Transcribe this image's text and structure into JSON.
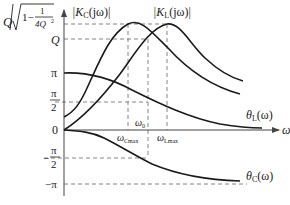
{
  "diagram": {
    "title": "",
    "x_axis": {
      "label": "ω"
    },
    "y_axis_labels": {
      "top_prefix": "Q",
      "top_num": "1",
      "top_den": "4Q",
      "top_den_exp": "2",
      "top_one_minus": "1−",
      "q": "Q",
      "pi": "π",
      "pi_half_num": "π",
      "pi_half_den": "2",
      "zero": "0",
      "neg_pi_half_num": "π",
      "neg_pi_half_den": "2",
      "neg_pi_half_sign": "−",
      "neg_pi": "−π"
    },
    "curves": {
      "kc": "|K",
      "kc_sub": "C",
      "kc_tail": "(jω)|",
      "kl": "|K",
      "kl_sub": "L",
      "kl_tail": "(jω)|",
      "theta_l": "θ",
      "theta_l_sub": "L",
      "theta_l_tail": "(ω)",
      "theta_c": "θ",
      "theta_c_sub": "C",
      "theta_c_tail": "(ω)"
    },
    "freq_labels": {
      "w0": "ω",
      "w0_sub": "0",
      "wc": "ω",
      "wc_sub": "Cmax",
      "wl": "ω",
      "wl_sub": "Lmax"
    }
  }
}
